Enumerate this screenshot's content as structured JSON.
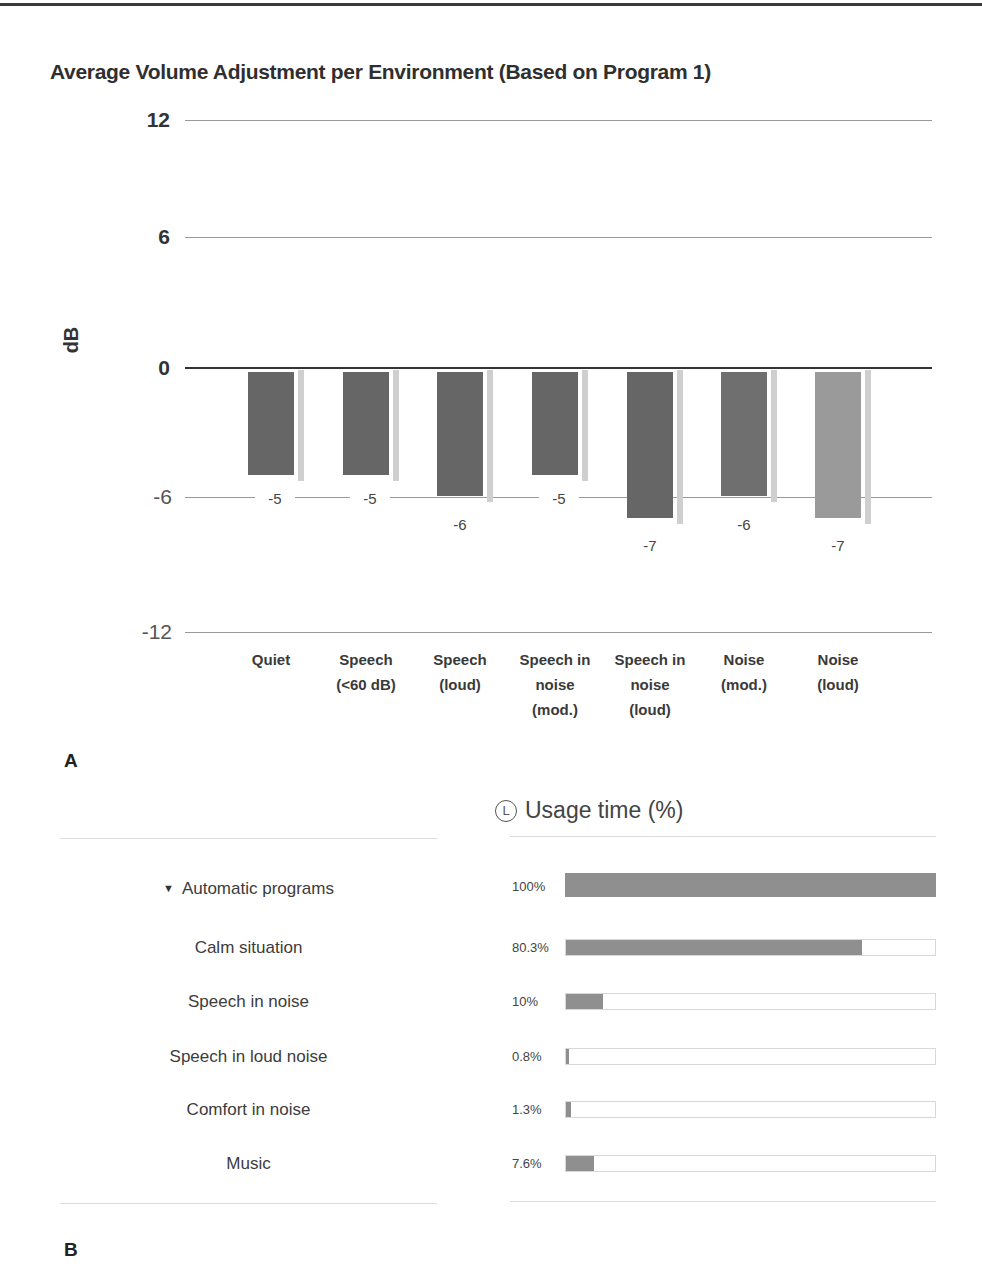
{
  "panel_a": {
    "label": "A",
    "title": "Average Volume Adjustment per Environment (Based on Program 1)",
    "y_axis_label": "dB",
    "y_ticks": [
      "12",
      "6",
      "0",
      "-6",
      "-12"
    ]
  },
  "panel_b": {
    "label": "B",
    "header": {
      "icon": "L",
      "title": "Usage time (%)"
    },
    "group": {
      "label": "Automatic programs",
      "value_label": "100%",
      "value": 100
    },
    "programs": [
      {
        "name": "Calm situation",
        "value_label": "80.3%",
        "value": 80.3
      },
      {
        "name": "Speech in noise",
        "value_label": "10%",
        "value": 10
      },
      {
        "name": "Speech in loud noise",
        "value_label": "0.8%",
        "value": 0.8
      },
      {
        "name": "Comfort in noise",
        "value_label": "1.3%",
        "value": 1.3
      },
      {
        "name": "Music",
        "value_label": "7.6%",
        "value": 7.6
      }
    ]
  },
  "colors": {
    "bar_dark": "#666666",
    "bar_mid": "#6f6f6f",
    "bar_light": "#9a9a9a",
    "usage_fill": "#8f8f8f"
  },
  "chart_data": [
    {
      "type": "bar",
      "title": "Average Volume Adjustment per Environment (Based on Program 1)",
      "xlabel": "",
      "ylabel": "dB",
      "ylim": [
        -12,
        12
      ],
      "yticks": [
        12,
        6,
        0,
        -6,
        -12
      ],
      "grid": true,
      "legend": null,
      "categories": [
        "Quiet",
        "Speech (<60 dB)",
        "Speech (loud)",
        "Speech in noise (mod.)",
        "Speech in noise (loud)",
        "Noise (mod.)",
        "Noise (loud)"
      ],
      "category_labels": [
        "Quiet",
        "Speech\n(<60 dB)",
        "Speech\n(loud)",
        "Speech in\nnoise\n(mod.)",
        "Speech in\nnoise\n(loud)",
        "Noise\n(mod.)",
        "Noise\n(loud)"
      ],
      "values": [
        -5,
        -5,
        -6,
        -5,
        -7,
        -6,
        -7
      ],
      "value_labels": [
        "-5",
        "-5",
        "-6",
        "-5",
        "-7",
        "-6",
        "-7"
      ]
    },
    {
      "type": "bar",
      "orientation": "horizontal",
      "title": "Usage time (%)",
      "categories": [
        "Automatic programs",
        "Calm situation",
        "Speech in noise",
        "Speech in loud noise",
        "Comfort in noise",
        "Music"
      ],
      "values": [
        100,
        80.3,
        10,
        0.8,
        1.3,
        7.6
      ],
      "value_labels": [
        "100%",
        "80.3%",
        "10%",
        "0.8%",
        "1.3%",
        "7.6%"
      ],
      "xlim": [
        0,
        100
      ]
    }
  ]
}
